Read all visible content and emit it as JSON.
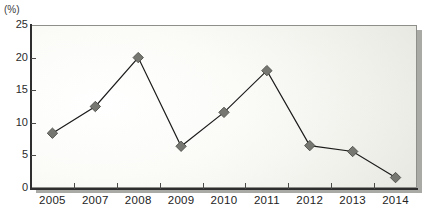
{
  "figure": {
    "unit_label": "(%)",
    "title_remnant": "",
    "accent_color": "#6f6f6c",
    "marker_color": "#777772",
    "line_color": "#1c1c1c",
    "axis_color": "#2e2e2e",
    "plot_bg_light": "#ffffff",
    "plot_bg_dark": "#deded7",
    "shadow_color": "#a9a9a6"
  },
  "chart_data": {
    "type": "line",
    "title": "",
    "subtitle": "",
    "xlabel": "",
    "ylabel": "",
    "unit": "(%)",
    "categories": [
      "2005",
      "2007",
      "2008",
      "2009",
      "2010",
      "2011",
      "2012",
      "2013",
      "2014"
    ],
    "values": [
      8.4,
      12.5,
      20.0,
      6.4,
      11.6,
      18.0,
      6.5,
      5.6,
      1.6
    ],
    "series": [
      {
        "name": "",
        "values": [
          8.4,
          12.5,
          20.0,
          6.4,
          11.6,
          18.0,
          6.5,
          5.6,
          1.6
        ]
      }
    ],
    "ylim": [
      0,
      25
    ],
    "yticks": [
      0,
      5,
      10,
      15,
      20,
      25
    ],
    "ytick_labels": [
      "0",
      "5",
      "10",
      "15",
      "20",
      "25"
    ],
    "xtick_labels": [
      "2005",
      "2007",
      "2008",
      "2009",
      "2010",
      "2011",
      "2012",
      "2013",
      "2014"
    ],
    "grid": false,
    "legend": "none",
    "marker": "diamond",
    "annotations": []
  }
}
